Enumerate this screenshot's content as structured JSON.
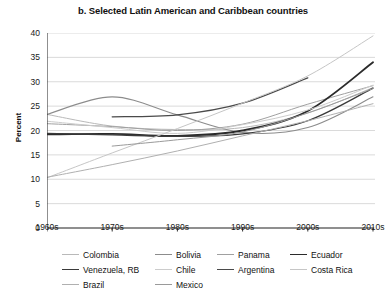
{
  "chart_data": {
    "type": "line",
    "title": "b. Selected Latin American and Caribbean countries",
    "xlabel": "",
    "ylabel": "Percent",
    "categories": [
      "1960s",
      "1970s",
      "1980s",
      "1990s",
      "2000s",
      "2010s"
    ],
    "x": [
      1960,
      1970,
      1980,
      1990,
      2000,
      2010
    ],
    "ylim": [
      0,
      40
    ],
    "yticks": [
      0,
      5,
      10,
      15,
      20,
      25,
      30,
      35,
      40
    ],
    "grid": "horizontal",
    "legend_position": "bottom",
    "series": [
      {
        "name": "Colombia",
        "color": "#b9b9b9",
        "width": 1.0,
        "x": [
          1960,
          1970,
          1980,
          1990,
          2000,
          2010
        ],
        "values": [
          23.3,
          20.9,
          20.2,
          20.6,
          23.6,
          28.8
        ]
      },
      {
        "name": "Bolivia",
        "color": "#8c8c8c",
        "width": 1.1,
        "x": [
          1960,
          1970,
          1980,
          1990,
          2000,
          2010
        ],
        "values": [
          23.3,
          26.9,
          23.2,
          19.6,
          20.6,
          26.9
        ]
      },
      {
        "name": "Panama",
        "color": "#a0a0a0",
        "width": 1.0,
        "x": [
          1960,
          1970,
          1980,
          1990,
          2000,
          2010
        ],
        "values": [
          21.4,
          20.8,
          20.0,
          21.3,
          25.4,
          29.2
        ]
      },
      {
        "name": "Ecuador",
        "color": "#2b2b2b",
        "width": 1.9,
        "x": [
          1960,
          1970,
          1980,
          1990,
          2000,
          2010
        ],
        "values": [
          19.2,
          19.3,
          18.9,
          20.0,
          24.0,
          34.0
        ]
      },
      {
        "name": "Venezuela, RB",
        "color": "#3a3a3a",
        "width": 1.3,
        "x": [
          1960,
          1970,
          1980,
          1990,
          2000,
          2010
        ],
        "values": [
          19.4,
          19.1,
          18.8,
          19.3,
          22.0,
          28.7
        ]
      },
      {
        "name": "Chile",
        "color": "#cccccc",
        "width": 1.0,
        "x": [
          1960,
          1970,
          1980,
          1990,
          2000,
          2010
        ],
        "values": [
          21.9,
          20.6,
          19.4,
          21.2,
          24.2,
          29.3
        ]
      },
      {
        "name": "Argentina",
        "color": "#4a4a4a",
        "width": 1.3,
        "x": [
          1970,
          1980,
          1990,
          2000
        ],
        "values": [
          22.8,
          23.2,
          25.6,
          30.8
        ]
      },
      {
        "name": "Costa Rica",
        "color": "#c6c6c6",
        "width": 1.0,
        "x": [
          1960,
          1970,
          1980,
          1990,
          2000,
          2010
        ],
        "values": [
          10.3,
          15.4,
          20.4,
          25.6,
          31.2,
          39.4
        ]
      },
      {
        "name": "Brazil",
        "color": "#b0b0b0",
        "width": 1.0,
        "x": [
          1960,
          1970,
          1980,
          1990,
          2000,
          2010
        ],
        "values": [
          10.4,
          13.0,
          15.8,
          18.9,
          22.0,
          25.5
        ]
      },
      {
        "name": "Mexico",
        "color": "#9a9a9a",
        "width": 1.0,
        "x": [
          1970,
          1980,
          1990,
          2000,
          2010
        ],
        "values": [
          16.8,
          18.1,
          19.7,
          23.6,
          28.6
        ]
      }
    ]
  },
  "legend_rows": [
    [
      {
        "label": "Colombia",
        "series": 0
      },
      {
        "label": "Bolivia",
        "series": 1
      },
      {
        "label": "Panama",
        "series": 2
      },
      {
        "label": "Ecuador",
        "series": 3
      }
    ],
    [
      {
        "label": "Venezuela, RB",
        "series": 4
      },
      {
        "label": "Chile",
        "series": 5
      },
      {
        "label": "Argentina",
        "series": 6
      },
      {
        "label": "Costa Rica",
        "series": 7
      }
    ],
    [
      {
        "label": "Brazil",
        "series": 8
      },
      {
        "label": "Mexico",
        "series": 9
      }
    ]
  ],
  "colors": {
    "axis": "#333333",
    "grid": "#d0d0d0",
    "text": "#1a1a1a",
    "background": "#ffffff"
  }
}
